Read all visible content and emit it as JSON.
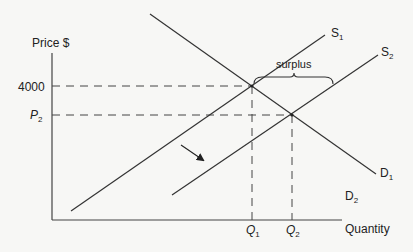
{
  "diagram": {
    "type": "supply-demand",
    "axes": {
      "y_label": "Price $",
      "x_label": "Quantity"
    },
    "price_ticks": [
      {
        "label": "4000",
        "is_variable": false
      },
      {
        "label": "P",
        "sub": "2",
        "is_variable": true
      }
    ],
    "quantity_ticks": [
      {
        "label": "Q",
        "sub": "1"
      },
      {
        "label": "Q",
        "sub": "2"
      }
    ],
    "curves": {
      "S1": {
        "label": "S",
        "sub": "1"
      },
      "S2": {
        "label": "S",
        "sub": "2"
      },
      "D1": {
        "label": "D",
        "sub": "1"
      },
      "D2": {
        "label": "D",
        "sub": "2"
      }
    },
    "annotation": {
      "surplus_label": "surplus"
    },
    "shift_arrow": "arrow-down-right",
    "line_color": "#333333",
    "background": "#f7f7f5"
  }
}
